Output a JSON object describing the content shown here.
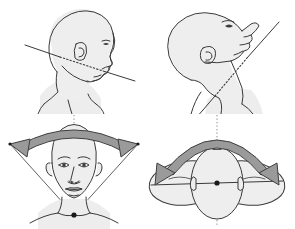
{
  "figure": {
    "background_color": "#ffffff",
    "line_color": "#3a3a3a",
    "skin_fill": "#eeeeee",
    "arrow_fill": "#9a9a9a",
    "arrow_stroke": "#3f3f3f",
    "axis_color": "#7a7a7a",
    "pivot_color": "#1a1a1a",
    "panel_count": 4
  },
  "panels": [
    {
      "id": "flexion",
      "name": "head-neck-flexion",
      "position": "top-left",
      "view": "lateral-profile-facing-right",
      "caption": "",
      "motion": "flexion",
      "reference_line": {
        "style": "solid-outside-dotted-inside",
        "orientation": "diagonal-down-to-the-right",
        "from": [
          25,
          45
        ],
        "to": [
          135,
          81
        ]
      },
      "features": [
        "cranium",
        "ear",
        "eye",
        "nose",
        "lips",
        "chin",
        "jawline",
        "neck",
        "shoulder"
      ]
    },
    {
      "id": "extension",
      "name": "head-neck-extension",
      "position": "top-right",
      "view": "lateral-profile-head-tilted-back",
      "caption": "",
      "motion": "extension",
      "reference_line": {
        "style": "solid-outside-dotted-inside",
        "orientation": "diagonal-up-to-the-right",
        "from": [
          24,
          146
        ],
        "to": [
          132,
          22
        ]
      },
      "features": [
        "cranium",
        "ear",
        "eye",
        "nose",
        "lips",
        "chin",
        "throat",
        "neck",
        "shoulder"
      ]
    },
    {
      "id": "lateral-flexion",
      "name": "head-lateral-flexion",
      "position": "bottom-left",
      "view": "frontal-face",
      "caption": "",
      "motion": "lateral-flexion-side-bending",
      "arrow": {
        "type": "double-headed-curved-arrow",
        "curvature": "shallow-arc",
        "direction": "left-and-right",
        "fill": "#9a9a9a",
        "stroke": "#3f3f3f"
      },
      "axis": {
        "style": "dotted-vertical-midline",
        "color": "#7a7a7a"
      },
      "pivot": {
        "label": "pivot-point",
        "location": "base-of-neck",
        "color": "#1a1a1a"
      },
      "range_lines": "thin-v-shaped-cone-from-pivot-to-arrow-tips",
      "features": [
        "cranium",
        "eyebrows",
        "eyes",
        "nose",
        "lips",
        "ears",
        "neck",
        "shoulders"
      ]
    },
    {
      "id": "rotation",
      "name": "head-rotation",
      "position": "bottom-right",
      "view": "superior-top-down",
      "caption": "",
      "motion": "rotation-left-and-right",
      "arrow": {
        "type": "double-headed-curved-arrow",
        "curvature": "semicircular-arc",
        "direction": "left-and-right",
        "fill": "#9a9a9a",
        "stroke": "#3f3f3f"
      },
      "axis": {
        "style": "dotted-vertical-midline",
        "color": "#7a7a7a"
      },
      "pivot": {
        "label": "pivot-point",
        "location": "centre-of-skull",
        "color": "#1a1a1a"
      },
      "features": [
        "central-head-oval",
        "nose-marker",
        "ears",
        "rotated-head-left",
        "rotated-head-right",
        "horizontal-axis-line"
      ]
    }
  ]
}
